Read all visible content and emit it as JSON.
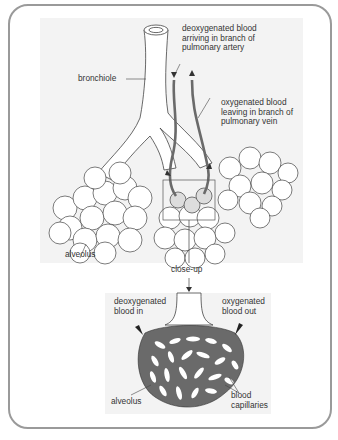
{
  "diagram": {
    "colors": {
      "frame_border": "#9a9a9a",
      "panel_bg": "#f3f3f3",
      "outline": "#444444",
      "vessel": "#6a6a6a",
      "label_text": "#333333"
    },
    "top_panel": {
      "labels": {
        "artery": "deoxygenated blood\narriving in branch of\npulmonary artery",
        "bronchiole": "bronchiole",
        "vein": "oxygenated blood\nleaving in branch of\npulmonary vein",
        "alveolus": "alveolus"
      }
    },
    "connector": {
      "label": "close-up"
    },
    "bottom_panel": {
      "labels": {
        "blood_in": "deoxygenated\nblood in",
        "blood_out": "oxygenated\nblood out",
        "alveolus": "alveolus",
        "capillaries": "blood\ncapillaries"
      }
    }
  }
}
